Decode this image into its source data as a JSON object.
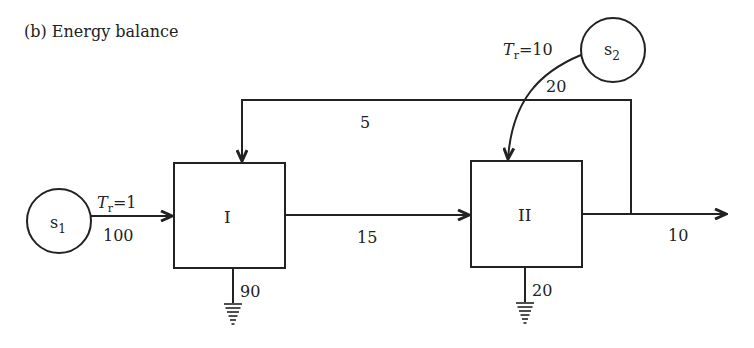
{
  "title": "(b) Energy balance",
  "colors": {
    "stroke": "#222222",
    "background": "#ffffff"
  },
  "nodes": {
    "s1": {
      "label": "s",
      "sub": "1"
    },
    "s2": {
      "label": "s",
      "sub": "2"
    },
    "box1": {
      "label": "I"
    },
    "box2": {
      "label": "II"
    }
  },
  "flows": {
    "s1_to_I": {
      "tr_symbol": "T",
      "tr_sub": "r",
      "tr_value": "=1",
      "value": "100"
    },
    "s2_to_II": {
      "tr_symbol": "T",
      "tr_sub": "r",
      "tr_value": "=10",
      "value": "20"
    },
    "I_to_II": {
      "value": "15"
    },
    "feedback_II_to_I": {
      "value": "5"
    },
    "II_out": {
      "value": "10"
    },
    "I_loss": {
      "value": "90"
    },
    "II_loss": {
      "value": "20"
    }
  }
}
